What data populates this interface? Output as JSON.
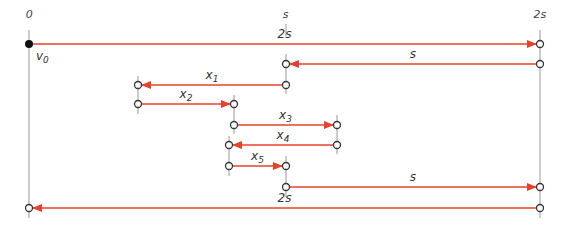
{
  "diagram": {
    "title": "",
    "colors": {
      "arrow": "#e8402a",
      "axis": "#999999",
      "node_stroke": "#333333",
      "origin_fill": "#111111",
      "text": "#333333"
    },
    "axis_labels": [
      {
        "id": "zero",
        "text": "0",
        "x": 29
      },
      {
        "id": "s",
        "text": "s",
        "x": 286
      },
      {
        "id": "two-s",
        "text": "2s",
        "x": 540
      }
    ],
    "origin_label": {
      "text": "v",
      "sub": "0"
    },
    "segments": [
      {
        "id": "seg-2s-forward",
        "label": "2s",
        "sub": "",
        "x1": 29,
        "x2": 540,
        "y": 44,
        "direction": "right"
      },
      {
        "id": "seg-s-return",
        "label": "s",
        "sub": "",
        "x1": 540,
        "x2": 286,
        "y": 64,
        "direction": "left"
      },
      {
        "id": "seg-x1",
        "label": "x",
        "sub": "1",
        "x1": 286,
        "x2": 138,
        "y": 85,
        "direction": "left"
      },
      {
        "id": "seg-x2",
        "label": "x",
        "sub": "2",
        "x1": 138,
        "x2": 234,
        "y": 104,
        "direction": "right"
      },
      {
        "id": "seg-x3",
        "label": "x",
        "sub": "3",
        "x1": 234,
        "x2": 337,
        "y": 125,
        "direction": "right"
      },
      {
        "id": "seg-x4",
        "label": "x",
        "sub": "4",
        "x1": 337,
        "x2": 229,
        "y": 145,
        "direction": "left"
      },
      {
        "id": "seg-x5",
        "label": "x",
        "sub": "5",
        "x1": 229,
        "x2": 286,
        "y": 166,
        "direction": "right"
      },
      {
        "id": "seg-s-forward",
        "label": "s",
        "sub": "",
        "x1": 286,
        "x2": 540,
        "y": 187,
        "direction": "right"
      },
      {
        "id": "seg-2s-return",
        "label": "2s",
        "sub": "",
        "x1": 540,
        "x2": 29,
        "y": 208,
        "direction": "left"
      }
    ]
  }
}
